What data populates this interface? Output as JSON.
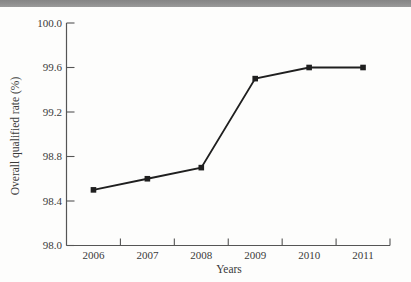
{
  "window": {
    "top_bar_color": "#8b8b8b",
    "page_background": "#fdfdfc"
  },
  "chart_data": {
    "type": "line",
    "title": "",
    "xlabel": "Years",
    "ylabel": "Overall qualified rate (%)",
    "categories": [
      "2006",
      "2007",
      "2008",
      "2009",
      "2010",
      "2011"
    ],
    "series": [
      {
        "name": "Overall qualified rate",
        "values": [
          98.5,
          98.6,
          98.7,
          99.5,
          99.6,
          99.6
        ]
      }
    ],
    "ylim": [
      98.0,
      100.0
    ],
    "yticks": [
      "98.0",
      "98.4",
      "98.8",
      "99.2",
      "99.6",
      "100.0"
    ],
    "grid": false,
    "legend": "none",
    "marker": "square",
    "line_color": "#1f1f1f",
    "marker_color": "#1f1f1f",
    "axis_color": "#555555",
    "text_color": "#3a3a3a"
  }
}
